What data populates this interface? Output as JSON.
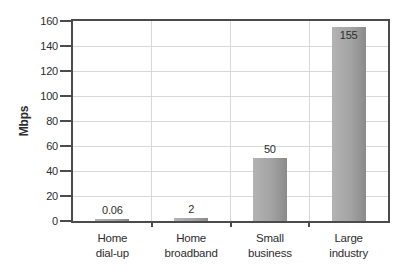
{
  "chart_data": {
    "type": "bar",
    "title": "",
    "xlabel": "",
    "ylabel": "Mbps",
    "categories": [
      "Home dial-up",
      "Home broadband",
      "Small business",
      "Large industry"
    ],
    "categories_display": [
      [
        "Home",
        "dial-up"
      ],
      [
        "Home",
        "broadband"
      ],
      [
        "Small",
        "business"
      ],
      [
        "Large",
        "industry"
      ]
    ],
    "category_ids": [
      "home-dial-up",
      "home-broadband",
      "small-business",
      "large-industry"
    ],
    "values": [
      0.06,
      2,
      50,
      155
    ],
    "value_labels": [
      "0.06",
      "2",
      "50",
      "155"
    ],
    "label_inside": [
      false,
      false,
      false,
      true
    ],
    "yticks": [
      0,
      20,
      40,
      60,
      80,
      100,
      120,
      140,
      160
    ],
    "ytick_labels": [
      "0",
      "20",
      "40",
      "60",
      "80",
      "100",
      "120",
      "140",
      "160"
    ],
    "ylim": [
      0,
      160
    ],
    "grid": "both",
    "legend": "none",
    "colors": {
      "bar_light": "#b3b3b3",
      "bar_mid": "#a3a3a3",
      "bar_dark": "#8a8a8a",
      "axis": "#4b4b4b",
      "gridline": "#d8d8d8",
      "text": "#2d2d2d",
      "background": "#ffffff"
    }
  }
}
